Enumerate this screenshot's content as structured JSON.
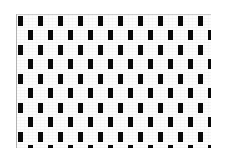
{
  "image": {
    "kind": "abstract-pattern",
    "description": "Staggered grid of small black vertical bars on a white plate",
    "width": 226,
    "height": 160,
    "background_color": "#ffffff"
  },
  "plate": {
    "x": 16,
    "y": 14,
    "width": 195,
    "height": 134,
    "fill_color": "#fdfdfd",
    "edge_color": "#b8b8b8",
    "has_left_edge_rule": true,
    "has_top_edge_rule": true
  },
  "pattern": {
    "motif": "vertical-bar",
    "bar_color": "#0a0a0a",
    "bar_width": 5,
    "bar_height": 10,
    "column_period": 20,
    "row_period": 15,
    "row_offset": 10,
    "columns_per_row": 10,
    "rows": 9,
    "stagger": "alternate-rows-offset-half-period",
    "bottom_row_clipped": true,
    "bottom_stub_height": 3
  },
  "chart_data": {
    "type": "heatmap",
    "title": "",
    "xlabel": "",
    "ylabel": "",
    "grid": false,
    "legend": "none",
    "note": "Binary (black/white) staggered bar lattice; value 1 = black bar present",
    "row_offsets": [
      0,
      10,
      0,
      10,
      0,
      10,
      0,
      10,
      0,
      10
    ],
    "rows": [
      {
        "y": 16,
        "offset": 0,
        "bars": [
          0,
          20,
          40,
          60,
          80,
          100,
          120,
          140,
          160,
          180
        ]
      },
      {
        "y": 30,
        "offset": 10,
        "bars": [
          10,
          30,
          50,
          70,
          90,
          110,
          130,
          150,
          170,
          190
        ]
      },
      {
        "y": 45,
        "offset": 0,
        "bars": [
          0,
          20,
          40,
          60,
          80,
          100,
          120,
          140,
          160,
          180
        ]
      },
      {
        "y": 59,
        "offset": 10,
        "bars": [
          10,
          30,
          50,
          70,
          90,
          110,
          130,
          150,
          170,
          190
        ]
      },
      {
        "y": 74,
        "offset": 0,
        "bars": [
          0,
          20,
          40,
          60,
          80,
          100,
          120,
          140,
          160,
          180
        ]
      },
      {
        "y": 88,
        "offset": 10,
        "bars": [
          10,
          30,
          50,
          70,
          90,
          110,
          130,
          150,
          170,
          190
        ]
      },
      {
        "y": 103,
        "offset": 0,
        "bars": [
          0,
          20,
          40,
          60,
          80,
          100,
          120,
          140,
          160,
          180
        ]
      },
      {
        "y": 117,
        "offset": 10,
        "bars": [
          10,
          30,
          50,
          70,
          90,
          110,
          130,
          150,
          170,
          190
        ]
      },
      {
        "y": 132,
        "offset": 0,
        "bars": [
          0,
          20,
          40,
          60,
          80,
          100,
          120,
          140,
          160,
          180
        ]
      },
      {
        "y": 145,
        "offset": 10,
        "bars": [
          10,
          30,
          50,
          70,
          90,
          110,
          130,
          150,
          170,
          190
        ]
      }
    ]
  }
}
